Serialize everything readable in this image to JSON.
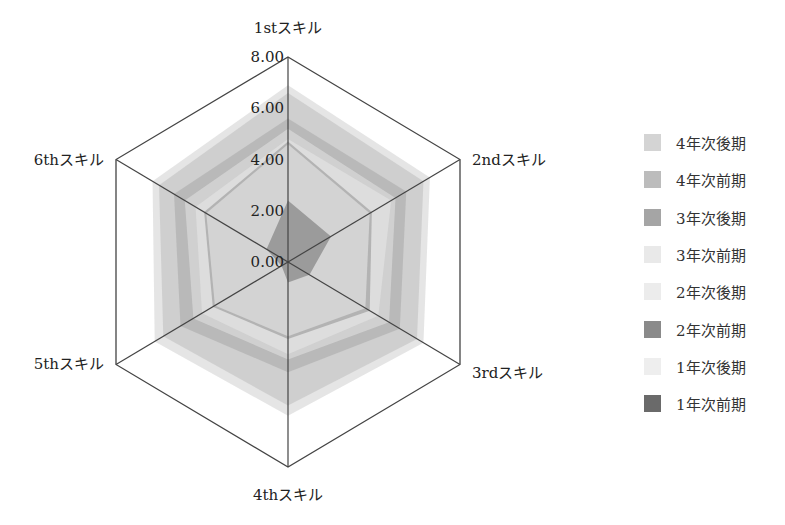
{
  "chart_data": {
    "type": "radar",
    "title": "",
    "categories": [
      "1stスキル",
      "2ndスキル",
      "3rdスキル",
      "4thスキル",
      "5thスキル",
      "6thスキル"
    ],
    "axis": {
      "min": 0,
      "max": 8,
      "ticks": [
        "0.00",
        "2.00",
        "4.00",
        "6.00",
        "8.00"
      ]
    },
    "legend_position": "right",
    "series": [
      {
        "name": "4年次後期",
        "color": "#cfcfcf",
        "values": [
          6.9,
          6.6,
          6.3,
          6.0,
          6.2,
          6.3
        ]
      },
      {
        "name": "4年次前期",
        "color": "#bdbdbd",
        "values": [
          6.6,
          6.3,
          6.0,
          5.6,
          5.8,
          6.0
        ]
      },
      {
        "name": "3年次後期",
        "color": "#a8a8a8",
        "values": [
          5.6,
          5.5,
          5.2,
          4.3,
          5.0,
          5.3
        ]
      },
      {
        "name": "3年次前期",
        "color": "#e3e3e3",
        "values": [
          5.2,
          5.0,
          4.7,
          3.8,
          4.4,
          4.8
        ]
      },
      {
        "name": "2年次後期",
        "color": "#e8e8e8",
        "values": [
          4.8,
          4.8,
          4.2,
          3.6,
          4.0,
          4.3
        ]
      },
      {
        "name": "2年次前期",
        "color": "#8f8f8f",
        "values": [
          4.7,
          3.9,
          3.8,
          3.0,
          3.5,
          3.9
        ]
      },
      {
        "name": "1年次後期",
        "color": "#ececec",
        "values": [
          4.6,
          3.8,
          3.6,
          2.9,
          3.4,
          3.8
        ]
      },
      {
        "name": "1年次前期",
        "color": "#6e6e6e",
        "values": [
          2.4,
          2.0,
          1.0,
          0.8,
          0.3,
          1.0
        ]
      }
    ]
  },
  "legend": {
    "items": [
      {
        "label": "4年次後期",
        "color": "#d4d4d4"
      },
      {
        "label": "4年次前期",
        "color": "#bcbcbc"
      },
      {
        "label": "3年次後期",
        "color": "#a5a5a5"
      },
      {
        "label": "3年次前期",
        "color": "#e9e9e9"
      },
      {
        "label": "2年次後期",
        "color": "#ececec"
      },
      {
        "label": "2年次前期",
        "color": "#8a8a8a"
      },
      {
        "label": "1年次後期",
        "color": "#eeeeee"
      },
      {
        "label": "1年次前期",
        "color": "#6a6a6a"
      }
    ]
  }
}
